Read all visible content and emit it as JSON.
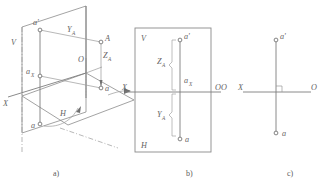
{
  "figure": {
    "line_color": "#8c8c8c",
    "text_color": "#646464",
    "background": "#ffffff"
  },
  "panels": [
    {
      "id": "a",
      "caption": "a)",
      "labels": {
        "plane_v": "V",
        "plane_h": "H",
        "axis_x": "X",
        "origin": "O",
        "point_a_prime": "a'",
        "point_a_x_base": "a",
        "point_a_x_sub": "X",
        "point_a_plan": "a",
        "point_a_lower": "a",
        "point_A": "A",
        "dim_y_base": "Y",
        "dim_y_sub": "A",
        "dim_z_base": "Z",
        "dim_z_sub": "A"
      }
    },
    {
      "id": "b",
      "caption": "b)",
      "labels": {
        "plane_v": "V",
        "plane_h": "H",
        "axis_x": "X",
        "origin": "O",
        "point_a_prime": "a'",
        "point_a_x_base": "a",
        "point_a_x_sub": "X",
        "point_a": "a",
        "dim_z_base": "Z",
        "dim_z_sub": "A",
        "dim_y_base": "Y",
        "dim_y_sub": "A"
      }
    },
    {
      "id": "c",
      "caption": "c)",
      "labels": {
        "axis_x": "X",
        "origin_left": "O",
        "origin_right": "O",
        "point_a_prime": "a'",
        "point_a": "a"
      }
    }
  ]
}
